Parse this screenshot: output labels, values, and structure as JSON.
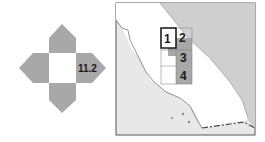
{
  "locator": {
    "page_number": "11.2",
    "colors": {
      "arrow_fill": "#a8a8a8",
      "land_fill": "#e6e6e6",
      "state_fill": "#ffffff",
      "neighbor_fill": "#d0d0d0",
      "highlight_fill": "#a8a8a8",
      "outline": "#555555"
    }
  },
  "map": {
    "region": "California",
    "sheets": [
      {
        "label": "1",
        "current": true
      },
      {
        "label": "2",
        "current": false
      },
      {
        "label": "3",
        "current": false
      },
      {
        "label": "4",
        "current": false
      }
    ]
  }
}
